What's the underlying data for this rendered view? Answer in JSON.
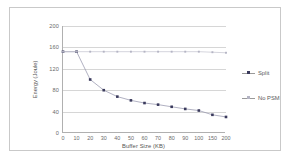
{
  "chart_data": {
    "type": "line",
    "title": "",
    "xlabel": "Buffer Size (KB)",
    "ylabel": "Energy (Joule)",
    "categories": [
      "0",
      "10",
      "20",
      "30",
      "40",
      "50",
      "60",
      "70",
      "80",
      "90",
      "100",
      "150",
      "200"
    ],
    "xticklabels": [
      "0",
      "10",
      "20",
      "30",
      "40",
      "50",
      "60",
      "70",
      "80",
      "90",
      "100",
      "150",
      "200"
    ],
    "yticklabels": [
      "0",
      "40",
      "80",
      "120",
      "160",
      "200"
    ],
    "ylim": [
      0,
      200
    ],
    "ytick_values": [
      0,
      40,
      80,
      120,
      160,
      200
    ],
    "grid": true,
    "legend_position": "right",
    "series": [
      {
        "name": "Split",
        "color": "#3a3a5c",
        "marker": "square",
        "values": [
          152,
          152,
          100,
          80,
          68,
          61,
          56,
          53,
          49,
          45,
          42,
          34,
          30
        ]
      },
      {
        "name": "No PSM",
        "color": "#b4b4c4",
        "marker": "square",
        "values": [
          152,
          152,
          152,
          152,
          152,
          152,
          152,
          152,
          152,
          152,
          152,
          151,
          150
        ]
      }
    ]
  },
  "legend": {
    "items": [
      {
        "label": "Split"
      },
      {
        "label": "No PSM"
      }
    ]
  },
  "colors": {
    "split": "#3a3a5c",
    "no_psm": "#b4b4c4",
    "grid": "#d6d6d6",
    "axis": "#b0b0b0",
    "text": "#6b6b6b",
    "border": "#c9c9c9",
    "background": "#ffffff"
  }
}
